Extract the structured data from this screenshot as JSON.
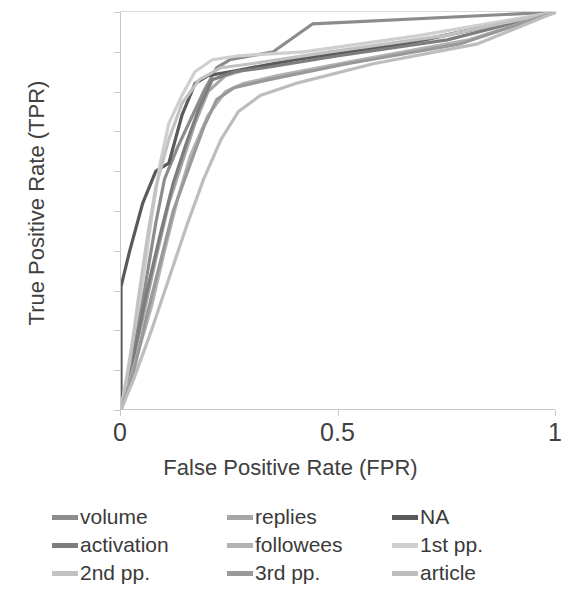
{
  "chart_data": {
    "type": "line",
    "title": "",
    "xlabel": "False Positive Rate (FPR)",
    "ylabel": "True Positive Rate (TPR)",
    "xlim": [
      0,
      1
    ],
    "ylim": [
      0,
      1
    ],
    "xticks": [
      "0",
      "0.5",
      "1"
    ],
    "xtick_values": [
      0,
      0.5,
      1
    ],
    "yticks": [
      "0",
      "0.1",
      "0.2",
      "0.3",
      "0.4",
      "0.5",
      "0.6",
      "0.7",
      "0.8",
      "0.9",
      "1"
    ],
    "ytick_values": [
      0,
      0.1,
      0.2,
      0.3,
      0.4,
      0.5,
      0.6,
      0.7,
      0.8,
      0.9,
      1
    ],
    "grid": false,
    "legend_position": "bottom",
    "legend_columns": 3,
    "series": [
      {
        "name": "volume",
        "color": "#8c8c8c",
        "x": [
          0,
          0.02,
          0.04,
          0.06,
          0.08,
          0.1,
          0.13,
          0.16,
          0.19,
          0.22,
          0.25,
          0.35,
          0.44,
          1
        ],
        "y": [
          0,
          0.1,
          0.22,
          0.34,
          0.47,
          0.58,
          0.66,
          0.73,
          0.8,
          0.86,
          0.88,
          0.9,
          0.97,
          1
        ]
      },
      {
        "name": "replies",
        "color": "#a6a6a6",
        "x": [
          0,
          0.02,
          0.05,
          0.08,
          0.11,
          0.14,
          0.17,
          0.2,
          0.24,
          0.3,
          0.45,
          0.7,
          1
        ],
        "y": [
          0,
          0.09,
          0.23,
          0.38,
          0.52,
          0.62,
          0.72,
          0.8,
          0.84,
          0.86,
          0.89,
          0.93,
          1
        ]
      },
      {
        "name": "NA",
        "color": "#5a5a5a",
        "x": [
          0,
          0,
          0.02,
          0.05,
          0.08,
          0.11,
          0.14,
          0.17,
          0.2,
          0.25,
          0.4,
          0.65,
          1
        ],
        "y": [
          0,
          0.31,
          0.4,
          0.52,
          0.6,
          0.62,
          0.74,
          0.82,
          0.84,
          0.85,
          0.88,
          0.92,
          1
        ]
      },
      {
        "name": "activation",
        "color": "#7d7d7d",
        "x": [
          0,
          0.03,
          0.06,
          0.09,
          0.12,
          0.15,
          0.18,
          0.21,
          0.26,
          0.33,
          0.5,
          0.75,
          1
        ],
        "y": [
          0,
          0.14,
          0.3,
          0.44,
          0.57,
          0.67,
          0.76,
          0.83,
          0.85,
          0.86,
          0.89,
          0.93,
          1
        ]
      },
      {
        "name": "followees",
        "color": "#b3b3b3",
        "x": [
          0,
          0.03,
          0.07,
          0.1,
          0.13,
          0.16,
          0.2,
          0.24,
          0.28,
          0.36,
          0.55,
          0.8,
          1
        ],
        "y": [
          0,
          0.11,
          0.26,
          0.4,
          0.53,
          0.64,
          0.74,
          0.8,
          0.82,
          0.84,
          0.88,
          0.93,
          1
        ]
      },
      {
        "name": "1st pp.",
        "color": "#cfcfcf",
        "x": [
          0,
          0.02,
          0.05,
          0.07,
          0.09,
          0.11,
          0.14,
          0.17,
          0.21,
          0.27,
          0.42,
          0.68,
          1
        ],
        "y": [
          0,
          0.13,
          0.32,
          0.48,
          0.62,
          0.72,
          0.79,
          0.85,
          0.88,
          0.89,
          0.9,
          0.94,
          1
        ]
      },
      {
        "name": "2nd pp.",
        "color": "#c2c2c2",
        "x": [
          0,
          0.02,
          0.04,
          0.06,
          0.08,
          0.11,
          0.14,
          0.18,
          0.23,
          0.3,
          0.48,
          0.74,
          1
        ],
        "y": [
          0,
          0.12,
          0.28,
          0.43,
          0.56,
          0.68,
          0.77,
          0.83,
          0.86,
          0.87,
          0.9,
          0.94,
          1
        ]
      },
      {
        "name": "3rd pp.",
        "color": "#999999",
        "x": [
          0,
          0.03,
          0.06,
          0.09,
          0.12,
          0.16,
          0.19,
          0.22,
          0.26,
          0.34,
          0.52,
          0.78,
          1
        ],
        "y": [
          0,
          0.1,
          0.24,
          0.37,
          0.5,
          0.62,
          0.71,
          0.78,
          0.81,
          0.83,
          0.87,
          0.92,
          1
        ]
      },
      {
        "name": "article",
        "color": "#bdbdbd",
        "x": [
          0,
          0.03,
          0.07,
          0.11,
          0.15,
          0.19,
          0.23,
          0.27,
          0.32,
          0.4,
          0.58,
          0.82,
          1
        ],
        "y": [
          0,
          0.08,
          0.2,
          0.33,
          0.46,
          0.58,
          0.68,
          0.75,
          0.79,
          0.82,
          0.87,
          0.92,
          1
        ]
      }
    ]
  },
  "legend": {
    "items": [
      {
        "label": "volume",
        "color": "#8c8c8c"
      },
      {
        "label": "replies",
        "color": "#a6a6a6"
      },
      {
        "label": "NA",
        "color": "#5a5a5a"
      },
      {
        "label": "activation",
        "color": "#7d7d7d"
      },
      {
        "label": "followees",
        "color": "#b3b3b3"
      },
      {
        "label": "1st pp.",
        "color": "#cfcfcf"
      },
      {
        "label": "2nd pp.",
        "color": "#c2c2c2"
      },
      {
        "label": "3rd pp.",
        "color": "#999999"
      },
      {
        "label": "article",
        "color": "#bdbdbd"
      }
    ]
  },
  "axes": {
    "y_title": "True Positive Rate (TPR)",
    "x_title": "False Positive Rate (FPR)"
  }
}
